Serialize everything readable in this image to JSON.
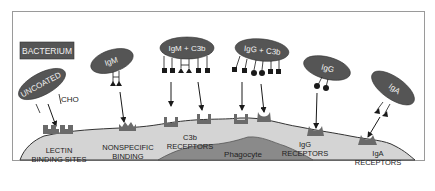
{
  "title_box": {
    "label": "BACTERIUM"
  },
  "bacteria": [
    {
      "id": "uncoated",
      "label": "UNCOATED",
      "annotation": "CHO"
    },
    {
      "id": "igm",
      "label": "IgM"
    },
    {
      "id": "igm-c3b",
      "label": "IgM + C3b"
    },
    {
      "id": "igg-c3b",
      "label": "IgG + C3b"
    },
    {
      "id": "igg",
      "label": "IgG"
    },
    {
      "id": "iga",
      "label": "IgA"
    }
  ],
  "receptors": [
    {
      "id": "lectin",
      "line1": "LECTIN",
      "line2": "BINDING SITES"
    },
    {
      "id": "nonspecific",
      "line1": "NONSPECIFIC",
      "line2": "BINDING"
    },
    {
      "id": "c3b",
      "line1": "C3b",
      "line2": "RECEPTORS"
    },
    {
      "id": "igg",
      "line1": "IgG",
      "line2": "RECEPTORS"
    },
    {
      "id": "iga",
      "line1": "IgA",
      "line2": "RECEPTORS"
    }
  ],
  "cell": {
    "label": "Phagocyte"
  },
  "colors": {
    "bacterium": "#555555",
    "cell": "#d4d4d4",
    "nucleus": "#8a8a8a",
    "receptor": "#6a6a6a",
    "frame": "#9a9a9a",
    "ink": "#1a1a1a"
  }
}
